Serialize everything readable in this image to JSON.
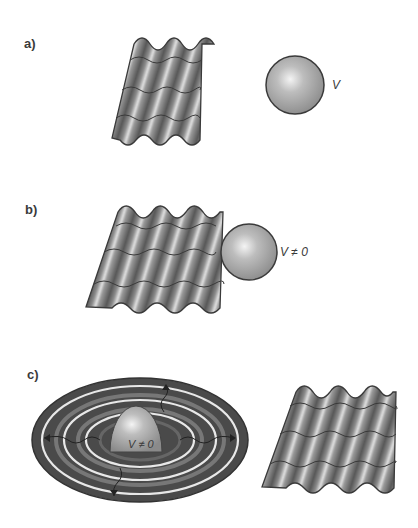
{
  "figure": {
    "panels": [
      {
        "id": "a",
        "label": "a)",
        "volume_label": "V",
        "description": "Wave sheet separated from sphere"
      },
      {
        "id": "b",
        "label": "b)",
        "volume_label": "V ≠ 0",
        "description": "Wave sheet in contact with sphere"
      },
      {
        "id": "c",
        "label": "c)",
        "volume_label": "V ≠ 0",
        "description": "Concentric ripples emanating from a hemisphere and a separate wave sheet"
      }
    ],
    "colors": {
      "background": "#ffffff",
      "surface_dark": "#4a4a4a",
      "surface_mid": "#8a8a8a",
      "surface_light": "#d8d8d8",
      "outline": "#3a3a3a",
      "text": "#3a3a3a"
    }
  }
}
